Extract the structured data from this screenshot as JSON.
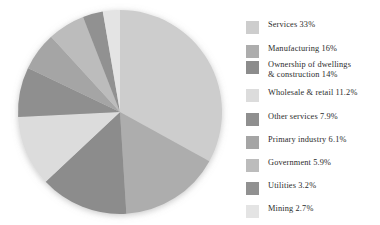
{
  "chart_data": {
    "type": "pie",
    "title": "",
    "subtitle": "",
    "xlabel": "",
    "ylabel": "",
    "legend_position": "right",
    "grid": false,
    "start_angle_deg": 0,
    "direction": "clockwise",
    "categories": [
      "Services",
      "Manufacturing",
      "Ownership of dwellings\n& construction",
      "Wholesale & retail",
      "Other services",
      "Primary industry",
      "Government",
      "Utilities",
      "Mining"
    ],
    "values": [
      33,
      16,
      14,
      11.2,
      7.9,
      6.1,
      5.9,
      3.2,
      2.7
    ],
    "value_labels": [
      "33%",
      "16%",
      "14%",
      "11.2%",
      "7.9%",
      "6.1%",
      "5.9%",
      "3.2%",
      "2.7%"
    ],
    "colors": [
      "#cdcdcd",
      "#adadad",
      "#8c8c8c",
      "#dcdcdc",
      "#8f8f8f",
      "#a5a5a5",
      "#bcbcbc",
      "#919191",
      "#e4e4e4"
    ],
    "legend_entries": [
      "Services 33%",
      "Manufacturing 16%",
      "Ownership of dwellings\n& construction 14%",
      "Wholesale & retail 11.2%",
      "Other services 7.9%",
      "Primary industry 6.1%",
      "Government 5.9%",
      "Utilities 3.2%",
      "Mining 2.7%"
    ]
  },
  "legend": {
    "rows": [
      {
        "label": "Services 33%",
        "color": "#cdcdcd",
        "top": 8
      },
      {
        "label": "Manufacturing 16%",
        "color": "#adadad",
        "top": 32
      },
      {
        "label": "Ownership of dwellings\n& construction 14%",
        "color": "#8c8c8c",
        "top": 48
      },
      {
        "label": "Wholesale & retail 11.2%",
        "color": "#dcdcdc",
        "top": 76
      },
      {
        "label": "Other services 7.9%",
        "color": "#8f8f8f",
        "top": 100
      },
      {
        "label": "Primary industry 6.1%",
        "color": "#a5a5a5",
        "top": 123
      },
      {
        "label": "Government 5.9%",
        "color": "#bcbcbc",
        "top": 146
      },
      {
        "label": "Utilities 3.2%",
        "color": "#919191",
        "top": 169
      },
      {
        "label": "Mining 2.7%",
        "color": "#e4e4e4",
        "top": 192
      }
    ]
  },
  "pie": {
    "center_x": 120,
    "center_y": 112,
    "radius": 102
  }
}
